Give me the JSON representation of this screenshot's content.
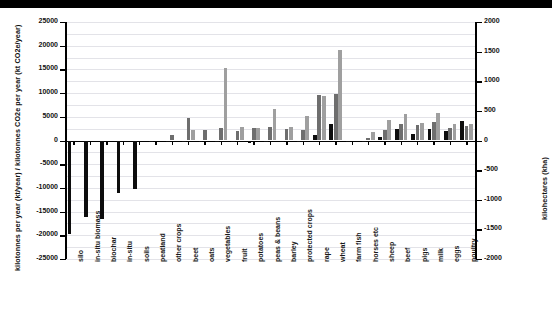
{
  "chart_data": {
    "type": "bar",
    "title": "",
    "subtitle": "",
    "xlabel": "",
    "ylabel": "kilotonnes per year (kt/year) / kilotonnes CO2e per year (kt CO2e/year)",
    "y2label": "kilohectares (kha)",
    "ylim": [
      -25000,
      25000
    ],
    "y2lim": [
      -2000,
      2000
    ],
    "yticks": [
      25000,
      20000,
      15000,
      10000,
      5000,
      0,
      -5000,
      -10000,
      -15000,
      -20000,
      -25000
    ],
    "ytick_labels": [
      "25000",
      "20000",
      "15000",
      "10000",
      "5000",
      "0",
      "-5000",
      "-10000",
      "-15000",
      "-20000",
      "-25000"
    ],
    "y2ticks": [
      2000,
      1500,
      1000,
      500,
      0,
      -500,
      -1000,
      -1500,
      -2000
    ],
    "y2tick_labels": [
      "2000",
      "1500",
      "1000",
      "500",
      "0",
      "-500",
      "-1000",
      "-1500",
      "-2000"
    ],
    "grid": true,
    "legend": "none",
    "categories": [
      "silo",
      "in-situ biomass",
      "biochar",
      "in-situ",
      "soils",
      "peatland",
      "other crops",
      "beet",
      "oats",
      "vegetables",
      "fruit",
      "potatoes",
      "peas & beans",
      "barley",
      "protected crops",
      "rape",
      "wheat",
      "farm fish",
      "horses etc",
      "sheep",
      "beef",
      "pigs",
      "milk",
      "eggs",
      "poultry"
    ],
    "series": [
      {
        "name": "series-dark",
        "color": "#0d0d0d",
        "values": [
          -19700,
          -16200,
          -16600,
          -11000,
          -10200,
          -400,
          -350,
          -300,
          -400,
          -350,
          -400,
          -450,
          -350,
          -400,
          -300,
          1200,
          3400,
          -200,
          -250,
          700,
          2400,
          1400,
          2400,
          2000,
          4100
        ]
      },
      {
        "name": "series-mid",
        "color": "#6e6e6e",
        "values": [
          0,
          0,
          0,
          0,
          0,
          0,
          1200,
          4800,
          2300,
          2600,
          2100,
          2700,
          2800,
          2400,
          2300,
          9600,
          9800,
          0,
          500,
          2300,
          3500,
          3300,
          3800,
          2700,
          3000
        ]
      },
      {
        "name": "series-light",
        "color": "#9f9f9f",
        "values": [
          0,
          0,
          0,
          0,
          0,
          0,
          0,
          2200,
          0,
          15200,
          2800,
          2600,
          6700,
          2900,
          5200,
          9300,
          19000,
          0,
          1800,
          4400,
          5600,
          3600,
          5800,
          3400,
          3500
        ]
      }
    ]
  }
}
